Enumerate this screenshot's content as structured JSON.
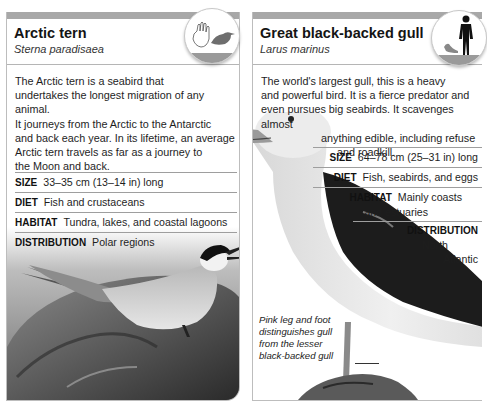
{
  "cards": [
    {
      "title": "Arctic tern",
      "latin_name": "Sterna paradisaea",
      "scale_badge": {
        "icon": "hand-and-bird-scale-icon"
      },
      "description_lines": [
        "The Arctic tern is a seabird that",
        "undertakes the longest migration of any animal.",
        "It journeys from the Arctic to the Antarctic",
        "and back each year. In its lifetime, an average",
        "Arctic tern travels as far as a journey to",
        "the Moon and back."
      ],
      "facts": [
        {
          "label": "SIZE",
          "value": "33–35 cm (13–14 in) long"
        },
        {
          "label": "DIET",
          "value": "Fish and crustaceans"
        },
        {
          "label": "HABITAT",
          "value": "Tundra, lakes, and coastal lagoons"
        },
        {
          "label": "DISTRIBUTION",
          "value": "Polar regions"
        }
      ],
      "photo": "arctic-tern-on-rock-photo"
    },
    {
      "title": "Great black-backed gull",
      "latin_name": "Larus marinus",
      "scale_badge": {
        "icon": "human-and-bird-scale-icon"
      },
      "description_lines": [
        "The world's largest gull, this is a heavy",
        "and powerful bird. It is a fierce predator and",
        "even pursues big seabirds. It scavenges almost",
        "anything edible, including refuse",
        "and roadkill."
      ],
      "facts": [
        {
          "label": "SIZE",
          "value": "64–78 cm (25–31 in) long"
        },
        {
          "label": "DIET",
          "value": "Fish, seabirds, and eggs"
        },
        {
          "label": "HABITAT",
          "value": "Mainly coasts",
          "value2": "and estuaries"
        },
        {
          "label": "DISTRIBUTION",
          "value": "North",
          "value2": "Atlantic"
        }
      ],
      "caption_lines": [
        "Pink leg and foot",
        "distinguishes gull",
        "from the lesser",
        "black-backed gull"
      ],
      "photo": "great-black-backed-gull-photo"
    }
  ],
  "colors": {
    "header_bar": "#a8a8a8",
    "border": "#bdbdbd",
    "text": "#1a1a1a"
  }
}
